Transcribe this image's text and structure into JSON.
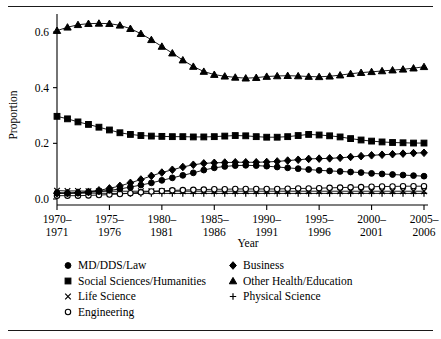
{
  "figure": {
    "rules": {
      "top": true,
      "bottom": true
    }
  },
  "chart_data": {
    "type": "line",
    "title": "",
    "xlabel": "Year",
    "ylabel": "Proportion",
    "grid": false,
    "legend_position": "bottom",
    "ylim": [
      0.0,
      0.65
    ],
    "yticks": [
      "0.0",
      "0.2",
      "0.4",
      "0.6"
    ],
    "ytick_values": [
      0.0,
      0.2,
      0.4,
      0.6
    ],
    "xtick_labels": [
      "1970–\n1971",
      "1975–\n1976",
      "1980–\n1981",
      "1985–\n1986",
      "1990–\n1991",
      "1995–\n1996",
      "2000–\n2001",
      "2005–\n2006"
    ],
    "xtick_labels_top": [
      "1970–",
      "1975–",
      "1980–",
      "1985–",
      "1990–",
      "1995–",
      "2000–",
      "2005–"
    ],
    "xtick_labels_bottom": [
      "1971",
      "1976",
      "1981",
      "1986",
      "1991",
      "1996",
      "2001",
      "2006"
    ],
    "xtick_indices": [
      0,
      5,
      10,
      15,
      20,
      25,
      30,
      35
    ],
    "x": [
      "1970-1971",
      "1971-1972",
      "1972-1973",
      "1973-1974",
      "1974-1975",
      "1975-1976",
      "1976-1977",
      "1977-1978",
      "1978-1979",
      "1979-1980",
      "1980-1981",
      "1981-1982",
      "1982-1983",
      "1983-1984",
      "1984-1985",
      "1985-1986",
      "1986-1987",
      "1987-1988",
      "1988-1989",
      "1989-1990",
      "1990-1991",
      "1991-1992",
      "1992-1993",
      "1993-1994",
      "1994-1995",
      "1995-1996",
      "1996-1997",
      "1997-1998",
      "1998-1999",
      "1999-2000",
      "2000-2001",
      "2001-2002",
      "2002-2003",
      "2003-2004",
      "2004-2005",
      "2005-2006"
    ],
    "series": [
      {
        "name": "MD/DDS/Law",
        "marker": "filled-circle",
        "values": [
          0.022,
          0.021,
          0.022,
          0.024,
          0.027,
          0.031,
          0.036,
          0.043,
          0.05,
          0.058,
          0.067,
          0.076,
          0.085,
          0.094,
          0.104,
          0.112,
          0.117,
          0.12,
          0.121,
          0.12,
          0.118,
          0.115,
          0.112,
          0.109,
          0.106,
          0.103,
          0.101,
          0.099,
          0.097,
          0.095,
          0.092,
          0.09,
          0.088,
          0.086,
          0.084,
          0.082
        ]
      },
      {
        "name": "Social Sciences/Humanities",
        "marker": "filled-square",
        "values": [
          0.297,
          0.288,
          0.277,
          0.268,
          0.258,
          0.248,
          0.238,
          0.232,
          0.228,
          0.226,
          0.225,
          0.224,
          0.224,
          0.223,
          0.223,
          0.224,
          0.226,
          0.228,
          0.227,
          0.224,
          0.222,
          0.222,
          0.224,
          0.228,
          0.232,
          0.23,
          0.227,
          0.223,
          0.217,
          0.212,
          0.208,
          0.205,
          0.203,
          0.202,
          0.201,
          0.201
        ]
      },
      {
        "name": "Life Science",
        "marker": "cross-x",
        "values": [
          0.03,
          0.029,
          0.029,
          0.028,
          0.028,
          0.028,
          0.028,
          0.028,
          0.028,
          0.028,
          0.028,
          0.028,
          0.028,
          0.028,
          0.028,
          0.028,
          0.028,
          0.028,
          0.028,
          0.028,
          0.028,
          0.028,
          0.028,
          0.028,
          0.028,
          0.028,
          0.028,
          0.028,
          0.028,
          0.028,
          0.028,
          0.028,
          0.028,
          0.028,
          0.028,
          0.028
        ]
      },
      {
        "name": "Engineering",
        "marker": "open-circle",
        "values": [
          0.012,
          0.012,
          0.012,
          0.013,
          0.014,
          0.016,
          0.018,
          0.021,
          0.024,
          0.027,
          0.029,
          0.031,
          0.032,
          0.033,
          0.034,
          0.035,
          0.035,
          0.036,
          0.036,
          0.036,
          0.036,
          0.036,
          0.037,
          0.038,
          0.038,
          0.039,
          0.04,
          0.041,
          0.042,
          0.043,
          0.044,
          0.045,
          0.045,
          0.046,
          0.046,
          0.046
        ]
      },
      {
        "name": "Business",
        "marker": "filled-diamond",
        "values": [
          0.02,
          0.021,
          0.023,
          0.026,
          0.031,
          0.038,
          0.047,
          0.058,
          0.07,
          0.083,
          0.095,
          0.105,
          0.115,
          0.123,
          0.128,
          0.13,
          0.131,
          0.132,
          0.132,
          0.132,
          0.133,
          0.135,
          0.138,
          0.141,
          0.144,
          0.145,
          0.146,
          0.148,
          0.151,
          0.154,
          0.157,
          0.159,
          0.161,
          0.163,
          0.165,
          0.166
        ]
      },
      {
        "name": "Other Health/Education",
        "marker": "filled-triangle",
        "values": [
          0.605,
          0.617,
          0.626,
          0.63,
          0.631,
          0.63,
          0.624,
          0.612,
          0.594,
          0.572,
          0.548,
          0.524,
          0.499,
          0.476,
          0.458,
          0.447,
          0.441,
          0.437,
          0.434,
          0.436,
          0.44,
          0.442,
          0.443,
          0.442,
          0.44,
          0.439,
          0.441,
          0.445,
          0.45,
          0.454,
          0.457,
          0.46,
          0.463,
          0.466,
          0.47,
          0.475
        ]
      },
      {
        "name": "Physical Science",
        "marker": "plus",
        "values": [
          0.022,
          0.021,
          0.021,
          0.021,
          0.021,
          0.02,
          0.02,
          0.02,
          0.02,
          0.02,
          0.02,
          0.02,
          0.02,
          0.02,
          0.02,
          0.02,
          0.02,
          0.02,
          0.02,
          0.02,
          0.02,
          0.02,
          0.02,
          0.02,
          0.02,
          0.02,
          0.02,
          0.02,
          0.02,
          0.02,
          0.02,
          0.02,
          0.02,
          0.02,
          0.02,
          0.02
        ]
      }
    ],
    "legend": {
      "column_left": [
        {
          "label": "MD/DDS/Law",
          "marker": "filled-circle"
        },
        {
          "label": "Social Sciences/Humanities",
          "marker": "filled-square"
        },
        {
          "label": "Life Science",
          "marker": "cross-x"
        },
        {
          "label": "Engineering",
          "marker": "open-circle"
        }
      ],
      "column_right": [
        {
          "label": "Business",
          "marker": "filled-diamond"
        },
        {
          "label": "Other Health/Education",
          "marker": "filled-triangle"
        },
        {
          "label": "Physical Science",
          "marker": "plus"
        }
      ]
    }
  }
}
